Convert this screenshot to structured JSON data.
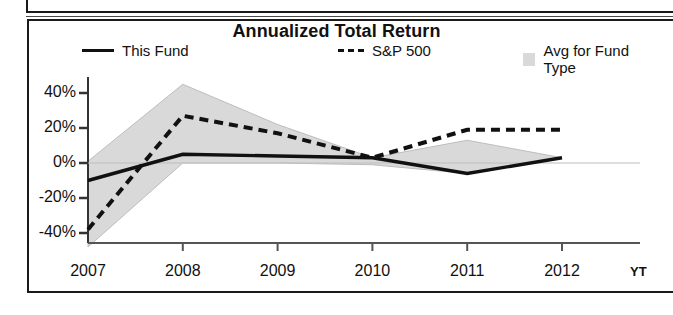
{
  "chart_title": "Annualized Total Return",
  "legend": {
    "fund": {
      "label": "This Fund",
      "marker": "solid-line-swatch"
    },
    "sp500": {
      "label": "S&P 500",
      "marker": "dashed-line-swatch"
    },
    "avg": {
      "label": "Avg for Fund Type",
      "marker": "gray-area-swatch"
    }
  },
  "axis": {
    "y_ticks": [
      "40%",
      "20%",
      "0%",
      "-20%",
      "-40%"
    ],
    "x_ticks": [
      "2007",
      "2008",
      "2009",
      "2010",
      "2011",
      "2012"
    ],
    "ytd_suffix": "YT"
  },
  "colors": {
    "line": "#111111",
    "band_fill": "#d9d9d9",
    "band_edge": "#b4b4b4",
    "frame": "#1a1a1a",
    "background": "#ffffff"
  },
  "chart_data": {
    "type": "line",
    "title": "Annualized Total Return",
    "xlabel": "",
    "ylabel": "",
    "x": [
      "2007",
      "2008",
      "2009",
      "2010",
      "2011",
      "2012"
    ],
    "categories": [
      "2007",
      "2008",
      "2009",
      "2010",
      "2011",
      "2012"
    ],
    "ylim": [
      -50,
      48
    ],
    "y_tick_values": [
      40,
      20,
      0,
      -20,
      -40
    ],
    "grid": false,
    "legend_position": "top",
    "units": "percent",
    "series": [
      {
        "name": "This Fund",
        "style": "solid",
        "values": [
          -10,
          5,
          4,
          3,
          -6,
          3
        ]
      },
      {
        "name": "S&P 500",
        "style": "dashed",
        "values": [
          -38,
          27,
          17,
          3,
          19,
          19
        ]
      },
      {
        "name": "Avg for Fund Type",
        "style": "area-band",
        "upper": [
          1,
          45,
          22,
          3,
          13,
          3
        ],
        "lower": [
          -48,
          0,
          0,
          -1,
          -6,
          3
        ]
      }
    ],
    "annotations": [
      "YT"
    ]
  }
}
